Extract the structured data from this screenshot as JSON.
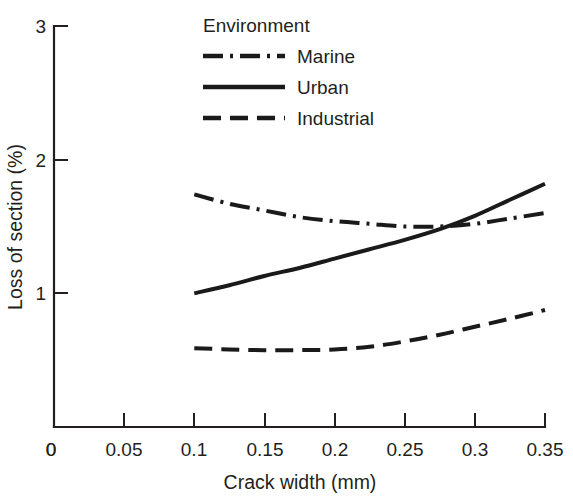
{
  "chart_data": {
    "type": "line",
    "title": "",
    "xlabel": "Crack width (mm)",
    "ylabel": "Loss of section (%)",
    "xlim": [
      0,
      0.35
    ],
    "ylim": [
      0,
      3
    ],
    "grid": false,
    "legend_position": "top-center",
    "legend_title": "Environment",
    "x_ticks": [
      0,
      0.05,
      0.1,
      0.15,
      0.2,
      0.25,
      0.3,
      0.35
    ],
    "x_tick_labels": [
      "0",
      "0.05",
      "0.1",
      "0.15",
      "0.2",
      "0.25",
      "0.3",
      "0.35"
    ],
    "y_ticks": [
      0,
      1,
      2,
      3
    ],
    "y_tick_labels": [
      "0",
      "1",
      "2",
      "3"
    ],
    "x": [
      0.1,
      0.125,
      0.15,
      0.175,
      0.2,
      0.225,
      0.25,
      0.275,
      0.3,
      0.325,
      0.35
    ],
    "series": [
      {
        "name": "Marine",
        "style": "dash-dot",
        "color": "#1a1a1a",
        "values": [
          1.74,
          1.67,
          1.62,
          1.57,
          1.54,
          1.52,
          1.5,
          1.5,
          1.52,
          1.56,
          1.6
        ]
      },
      {
        "name": "Urban",
        "style": "solid",
        "color": "#1a1a1a",
        "values": [
          1.0,
          1.06,
          1.13,
          1.19,
          1.26,
          1.33,
          1.4,
          1.48,
          1.58,
          1.7,
          1.82
        ]
      },
      {
        "name": "Industrial",
        "style": "dashed",
        "color": "#1a1a1a",
        "values": [
          0.59,
          0.58,
          0.575,
          0.575,
          0.58,
          0.6,
          0.64,
          0.69,
          0.75,
          0.81,
          0.875
        ]
      }
    ]
  },
  "axes": {
    "x_title": "Crack width (mm)",
    "y_title": "Loss of section (%)",
    "x_tick_labels": [
      "0",
      "0.05",
      "0.1",
      "0.15",
      "0.2",
      "0.25",
      "0.3",
      "0.35"
    ],
    "y_tick_labels": [
      "0",
      "1",
      "2",
      "3"
    ]
  },
  "legend": {
    "title": "Environment",
    "entries": [
      {
        "label": "Marine",
        "style": "dash-dot"
      },
      {
        "label": "Urban",
        "style": "solid"
      },
      {
        "label": "Industrial",
        "style": "dashed"
      }
    ]
  }
}
